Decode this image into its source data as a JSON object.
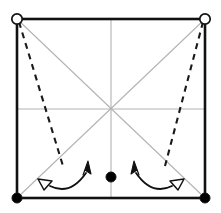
{
  "figure": {
    "title": "",
    "caption": "",
    "background_color": "#ffffff",
    "width": 221,
    "height": 213
  },
  "colors": {
    "outline": "#111111",
    "guide_gray": "#b3b3b3",
    "dashed": "#1a1a1a",
    "node_fill_open": "#ffffff",
    "node_fill_solid": "#000000",
    "arrow": "#111111"
  },
  "geometry": {
    "square": {
      "left": 17,
      "top": 19,
      "right": 205,
      "bottom": 198,
      "stroke_width": 2.6
    },
    "center": {
      "x": 111,
      "y": 109
    }
  },
  "nodes": [
    {
      "id": "node-top-left",
      "label": "",
      "type": "open-circle",
      "x": 17,
      "y": 19,
      "radius": 5.2
    },
    {
      "id": "node-top-right",
      "label": "",
      "type": "open-circle",
      "x": 205,
      "y": 19,
      "radius": 5.2
    },
    {
      "id": "node-bottom-left",
      "label": "",
      "type": "filled-circle",
      "x": 17,
      "y": 198,
      "radius": 5.0
    },
    {
      "id": "node-bottom-right",
      "label": "",
      "type": "filled-circle",
      "x": 205,
      "y": 198,
      "radius": 5.0
    },
    {
      "id": "node-center-bottom",
      "label": "",
      "type": "filled-circle",
      "x": 111,
      "y": 177,
      "radius": 5.0
    }
  ],
  "guide_lines": [
    {
      "id": "guide-horizontal-midline",
      "x1": 17,
      "y1": 109,
      "x2": 205,
      "y2": 109
    },
    {
      "id": "guide-vertical-midline",
      "x1": 111,
      "y1": 19,
      "x2": 111,
      "y2": 198
    },
    {
      "id": "guide-diagonal-tl-br",
      "x1": 17,
      "y1": 19,
      "x2": 205,
      "y2": 198
    },
    {
      "id": "guide-diagonal-tr-bl",
      "x1": 205,
      "y1": 19,
      "x2": 17,
      "y2": 198
    }
  ],
  "dashed_lines": [
    {
      "id": "dashed-left",
      "x1": 19,
      "y1": 22,
      "x2": 63,
      "y2": 166,
      "dash_pattern": "6,5",
      "stroke_width": 2.1
    },
    {
      "id": "dashed-right",
      "x1": 203,
      "y1": 22,
      "x2": 165,
      "y2": 166,
      "dash_pattern": "6,5",
      "stroke_width": 2.1
    }
  ],
  "arrows": [
    {
      "id": "arrow-left-rotation",
      "path": "M 47 186 Q 70 196 88 170",
      "stroke_width": 1.8,
      "start_head": "hollow-triangle",
      "end_head": "solid-arrow",
      "start_point": {
        "x": 47,
        "y": 186
      },
      "start_angle": 205,
      "end_point": {
        "x": 88,
        "y": 170
      },
      "end_angle": -56
    },
    {
      "id": "arrow-right-rotation",
      "path": "M 134 170 Q 152 196 175 186",
      "stroke_width": 1.8,
      "start_head": "solid-arrow",
      "end_head": "hollow-triangle",
      "start_point": {
        "x": 134,
        "y": 170
      },
      "start_angle": -124,
      "end_point": {
        "x": 175,
        "y": 186
      },
      "end_angle": -25
    }
  ]
}
